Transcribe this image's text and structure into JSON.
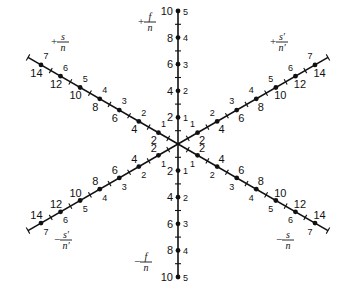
{
  "diagram": {
    "axes": [
      {
        "id": "f-positive",
        "direction": "up",
        "label": {
          "sign": "+",
          "numerator": "f",
          "denominator": "n"
        },
        "major": [
          "2",
          "4",
          "6",
          "8",
          "10"
        ],
        "minor": [
          "1",
          "2",
          "3",
          "4",
          "5"
        ]
      },
      {
        "id": "f-negative",
        "direction": "down",
        "label": {
          "sign": "−",
          "numerator": "f",
          "denominator": "n"
        },
        "major": [
          "2",
          "4",
          "6",
          "8",
          "10"
        ],
        "minor": [
          "1",
          "2",
          "3",
          "4",
          "5"
        ]
      },
      {
        "id": "s-positive",
        "direction": "upper-left",
        "label": {
          "sign": "+",
          "numerator": "s",
          "denominator": "n"
        },
        "major": [
          "2",
          "4",
          "6",
          "8",
          "10",
          "12",
          "14"
        ],
        "minor": [
          "1",
          "2",
          "3",
          "4",
          "5",
          "6",
          "7"
        ]
      },
      {
        "id": "s-negative",
        "direction": "lower-right",
        "label": {
          "sign": "−",
          "numerator": "s",
          "denominator": "n"
        },
        "major": [
          "2",
          "4",
          "6",
          "8",
          "10",
          "12",
          "14"
        ],
        "minor": [
          "1",
          "2",
          "3",
          "4",
          "5",
          "6",
          "7"
        ]
      },
      {
        "id": "s-prime-positive",
        "direction": "upper-right",
        "label": {
          "sign": "+",
          "numerator": "s′",
          "denominator": "n′"
        },
        "major": [
          "2",
          "4",
          "6",
          "8",
          "10",
          "12",
          "14"
        ],
        "minor": [
          "1",
          "2",
          "3",
          "4",
          "5",
          "6",
          "7"
        ]
      },
      {
        "id": "s-prime-negative",
        "direction": "lower-left",
        "label": {
          "sign": "−",
          "numerator": "s′",
          "denominator": "n′"
        },
        "major": [
          "2",
          "4",
          "6",
          "8",
          "10",
          "12",
          "14"
        ],
        "minor": [
          "1",
          "2",
          "3",
          "4",
          "5",
          "6",
          "7"
        ]
      }
    ]
  }
}
